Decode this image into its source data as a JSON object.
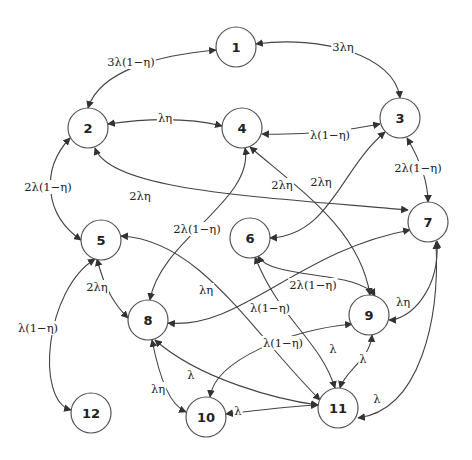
{
  "diagram": {
    "type": "state-transition-graph",
    "nodes": [
      {
        "id": "1",
        "label": "1"
      },
      {
        "id": "2",
        "label": "2"
      },
      {
        "id": "3",
        "label": "3"
      },
      {
        "id": "4",
        "label": "4"
      },
      {
        "id": "5",
        "label": "5"
      },
      {
        "id": "6",
        "label": "6"
      },
      {
        "id": "7",
        "label": "7"
      },
      {
        "id": "8",
        "label": "8"
      },
      {
        "id": "9",
        "label": "9"
      },
      {
        "id": "10",
        "label": "10"
      },
      {
        "id": "11",
        "label": "11"
      },
      {
        "id": "12",
        "label": "12"
      }
    ],
    "edges": [
      {
        "from": "1",
        "to": "2",
        "label": "3λ(1−η)"
      },
      {
        "from": "1",
        "to": "3",
        "label": "3λη"
      },
      {
        "from": "2",
        "to": "4",
        "label": "λη"
      },
      {
        "from": "2",
        "to": "5",
        "label": "2λ(1−η)"
      },
      {
        "from": "2",
        "to": "7",
        "label": "2λη"
      },
      {
        "from": "3",
        "to": "4",
        "label": "λ(1−η)"
      },
      {
        "from": "3",
        "to": "6",
        "label": "2λη"
      },
      {
        "from": "3",
        "to": "7",
        "label": "2λ(1−η)"
      },
      {
        "from": "4",
        "to": "8",
        "label": "2λ(1−η)"
      },
      {
        "from": "4",
        "to": "9",
        "label": "2λη"
      },
      {
        "from": "5",
        "to": "8",
        "label": "2λη"
      },
      {
        "from": "5",
        "to": "11",
        "label": "λη"
      },
      {
        "from": "5",
        "to": "12",
        "label": "λ(1−η)"
      },
      {
        "from": "6",
        "to": "9",
        "label": "2λ(1−η)"
      },
      {
        "from": "6",
        "to": "11",
        "label": "λ"
      },
      {
        "from": "7",
        "to": "8",
        "label": "λ(1−η)"
      },
      {
        "from": "7",
        "to": "9",
        "label": "λη"
      },
      {
        "from": "7",
        "to": "11",
        "label": "λ"
      },
      {
        "from": "8",
        "to": "10",
        "label": "λη"
      },
      {
        "from": "8",
        "to": "11",
        "label": "λ"
      },
      {
        "from": "9",
        "to": "10",
        "label": "λ(1−η)"
      },
      {
        "from": "9",
        "to": "11",
        "label": "λ"
      },
      {
        "from": "10",
        "to": "11",
        "label": "λ"
      }
    ]
  }
}
